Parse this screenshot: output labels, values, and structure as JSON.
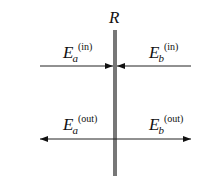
{
  "diagram": {
    "mirror_label": "R",
    "incoming": {
      "left": {
        "symbol": "E",
        "subscript": "a",
        "superscript": "(in)"
      },
      "right": {
        "symbol": "E",
        "subscript": "b",
        "superscript": "(in)"
      }
    },
    "outgoing": {
      "left": {
        "symbol": "E",
        "subscript": "a",
        "superscript": "(out)"
      },
      "right": {
        "symbol": "E",
        "subscript": "b",
        "superscript": "(out)"
      }
    },
    "colors": {
      "mirror": "#777777",
      "lines": "#222222"
    }
  }
}
